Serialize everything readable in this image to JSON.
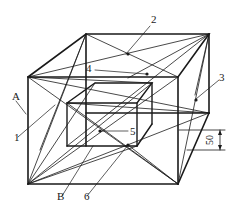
{
  "diagram": {
    "type": "isometric-box-with-inner-box-and-diagonals",
    "colors": {
      "stroke": "#1a1a1a",
      "background": "#ffffff"
    },
    "labels": {
      "A": "A",
      "B": "B",
      "n1": "1",
      "n2": "2",
      "n3": "3",
      "n4": "4",
      "n5": "5",
      "n6": "6"
    },
    "dimension": {
      "value": "50"
    }
  }
}
